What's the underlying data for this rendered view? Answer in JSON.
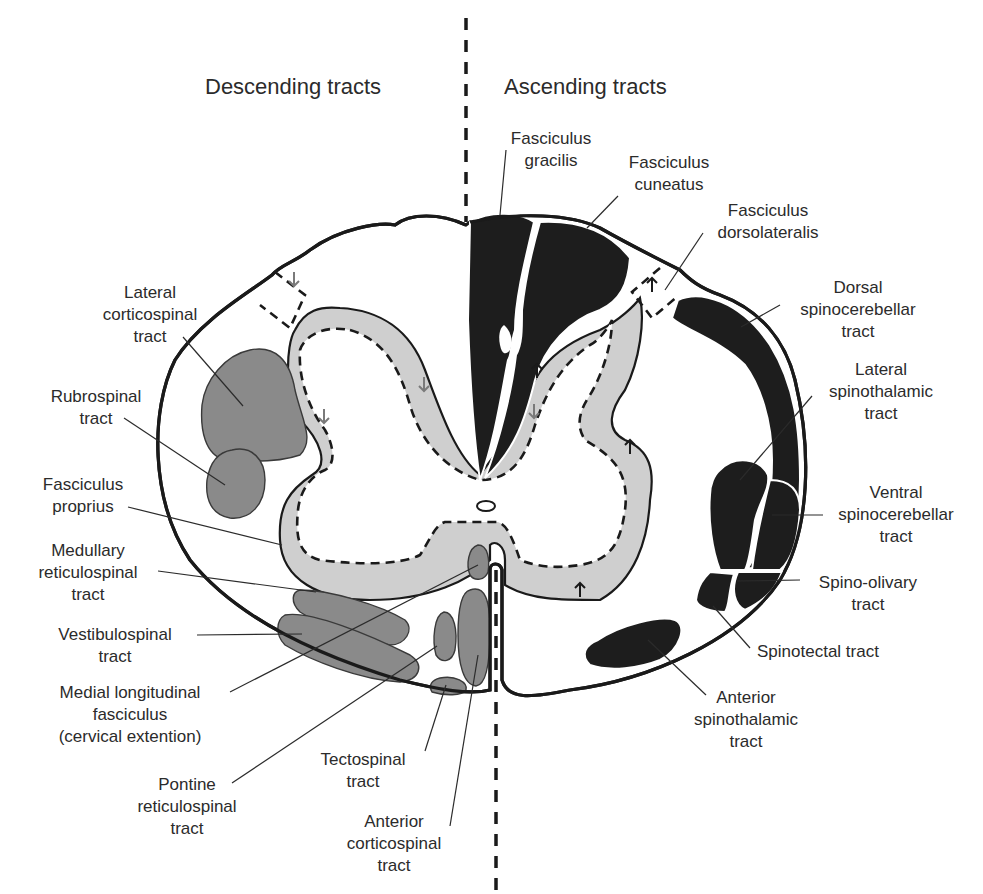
{
  "headers": {
    "left": "Descending tracts",
    "right": "Ascending tracts"
  },
  "descending_labels": {
    "lateral_corticospinal": [
      "Lateral",
      "corticospinal",
      "tract"
    ],
    "rubrospinal": [
      "Rubrospinal",
      "tract"
    ],
    "fasciculus_proprius": [
      "Fasciculus",
      "proprius"
    ],
    "medullary_reticulospinal": [
      "Medullary",
      "reticulospinal",
      "tract"
    ],
    "vestibulospinal": [
      "Vestibulospinal",
      "tract"
    ],
    "medial_longitudinal": [
      "Medial longitudinal",
      "fasciculus",
      "(cervical extention)"
    ],
    "pontine_reticulospinal": [
      "Pontine",
      "reticulospinal",
      "tract"
    ],
    "tectospinal": [
      "Tectospinal",
      "tract"
    ],
    "anterior_corticospinal": [
      "Anterior",
      "corticospinal",
      "tract"
    ]
  },
  "ascending_labels": {
    "fasciculus_gracilis": [
      "Fasciculus",
      "gracilis"
    ],
    "fasciculus_cuneatus": [
      "Fasciculus",
      "cuneatus"
    ],
    "fasciculus_dorsolateralis": [
      "Fasciculus",
      "dorsolateralis"
    ],
    "dorsal_spinocerebellar": [
      "Dorsal",
      "spinocerebellar",
      "tract"
    ],
    "lateral_spinothalamic": [
      "Lateral",
      "spinothalamic",
      "tract"
    ],
    "ventral_spinocerebellar": [
      "Ventral",
      "spinocerebellar",
      "tract"
    ],
    "spino_olivary": [
      "Spino-olivary",
      "tract"
    ],
    "spinotectal": [
      "Spinotectal tract"
    ],
    "anterior_spinothalamic": [
      "Anterior",
      "spinothalamic",
      "tract"
    ]
  },
  "colors": {
    "ascending_fill": "#1d1d1d",
    "descending_fill": "#8a8a8a",
    "fasciculus_proprius_fill": "#cfcfcf",
    "outline": "#1a1a1a",
    "text": "#2b2b2b"
  }
}
